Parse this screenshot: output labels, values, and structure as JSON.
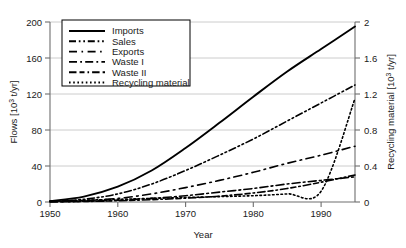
{
  "chart_data": {
    "type": "line",
    "title": "",
    "xlabel": "Year",
    "ylabel": "Flows [10³ t/yr]",
    "ylabel_right": "Recycling material [10³ t/yr]",
    "ylabel_main_text": "Flows [10",
    "ylabel_main_exp": "3",
    "ylabel_main_tail": " t/yr]",
    "ylabel_right_text": "Recycling material [10",
    "ylabel_right_exp": "3",
    "ylabel_right_tail": " t/yr]",
    "xlim": [
      1950,
      1995
    ],
    "ylim": [
      0,
      200
    ],
    "ylim_right": [
      0,
      2
    ],
    "grid": true,
    "legend_position": "top-left-inside",
    "xticks": [
      1950,
      1960,
      1970,
      1980,
      1990
    ],
    "xtick_labels": [
      "1950",
      "1960",
      "1970",
      "1980",
      "1990"
    ],
    "yticks": [
      0,
      40,
      80,
      120,
      160,
      200
    ],
    "ytick_labels": [
      "0",
      "40",
      "80",
      "120",
      "160",
      "200"
    ],
    "yticks_right": [
      0,
      0.4,
      0.8,
      1.2,
      1.6,
      2
    ],
    "ytick_labels_right": [
      "0",
      "0.4",
      "0.8",
      "1.2",
      "1.6",
      "2"
    ],
    "x": [
      1950,
      1955,
      1960,
      1965,
      1970,
      1975,
      1980,
      1985,
      1990,
      1995
    ],
    "series": [
      {
        "name": "Imports",
        "axis": "left",
        "dash": "none",
        "width": 1.9,
        "values": [
          1,
          6,
          17,
          35,
          60,
          88,
          117,
          145,
          170,
          195
        ]
      },
      {
        "name": "Sales",
        "axis": "left",
        "dash": "dash-dot-dot",
        "width": 1.6,
        "values": [
          0.5,
          3,
          9,
          20,
          35,
          52,
          70,
          90,
          110,
          130
        ]
      },
      {
        "name": "Exports",
        "axis": "left",
        "dash": "long-dash",
        "width": 1.6,
        "values": [
          0.3,
          1.5,
          4,
          9,
          16,
          24,
          33,
          43,
          52,
          62
        ]
      },
      {
        "name": "Waste I",
        "axis": "left",
        "dash": "dash-dot",
        "width": 1.6,
        "values": [
          0.2,
          0.8,
          2,
          4,
          7,
          11,
          15,
          20,
          24,
          28
        ]
      },
      {
        "name": "Waste II",
        "axis": "left",
        "dash": "dash-dash-dot",
        "width": 1.6,
        "values": [
          0.2,
          0.6,
          1.4,
          2.6,
          4.2,
          6.5,
          10,
          15,
          22,
          30
        ]
      },
      {
        "name": "Recycling material",
        "axis": "right",
        "dash": "dotted",
        "width": 1.6,
        "values": [
          0.01,
          0.02,
          0.03,
          0.04,
          0.05,
          0.06,
          0.07,
          0.09,
          0.12,
          1.15
        ]
      }
    ],
    "legend_entries": [
      {
        "label": "Imports",
        "dash": "none"
      },
      {
        "label": "Sales",
        "dash": "dash-dot-dot"
      },
      {
        "label": "Exports",
        "dash": "long-dash"
      },
      {
        "label": "Waste I",
        "dash": "dash-dot"
      },
      {
        "label": "Waste II",
        "dash": "dash-dash-dot"
      },
      {
        "label": "Recycling material",
        "dash": "dotted"
      }
    ],
    "line_color": "#000000",
    "grid_color": "#bfbfbf",
    "axis_color": "#808080",
    "background": "#ffffff"
  }
}
